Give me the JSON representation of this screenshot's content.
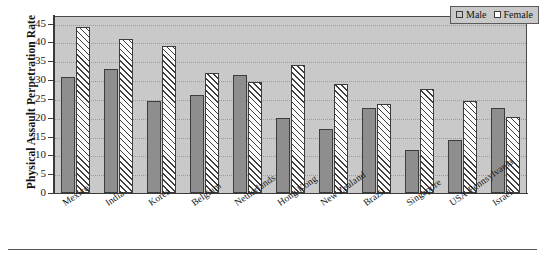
{
  "chart_data": {
    "type": "bar",
    "title": "",
    "xlabel": "",
    "ylabel": "Physical Assault Perpetration Rate",
    "ylim": [
      0,
      47
    ],
    "yticks": [
      0,
      5,
      10,
      15,
      20,
      25,
      30,
      35,
      40,
      45
    ],
    "grid": true,
    "legend_position": "top-right",
    "categories": [
      "Mexico",
      "India",
      "Korea",
      "Belgium",
      "Netherlands",
      "Hong Kong",
      "New Zealand",
      "Brazil",
      "Singapore",
      "USA-Pennsylvania",
      "Israel"
    ],
    "series": [
      {
        "name": "Male",
        "color": "#8e8e8e",
        "pattern": "solid",
        "values": [
          30.7,
          33.0,
          24.5,
          26.0,
          31.3,
          20.0,
          17.0,
          22.7,
          11.5,
          14.0,
          22.5
        ]
      },
      {
        "name": "Female",
        "color": "#ffffff",
        "pattern": "diagonal-hatch",
        "values": [
          44.0,
          41.0,
          39.0,
          32.0,
          29.5,
          34.0,
          29.0,
          23.6,
          27.7,
          24.5,
          20.3
        ]
      }
    ]
  },
  "legend": {
    "items": [
      {
        "label": "Male",
        "swatch": "gray-solid-swatch"
      },
      {
        "label": "Female",
        "swatch": "white-hatched-swatch"
      }
    ]
  },
  "axis": {
    "y_title": "Physical Assault Perpetration Rate",
    "y_tick_labels": [
      "45",
      "40",
      "35",
      "30",
      "25",
      "20",
      "15",
      "10",
      "5",
      "0"
    ]
  }
}
